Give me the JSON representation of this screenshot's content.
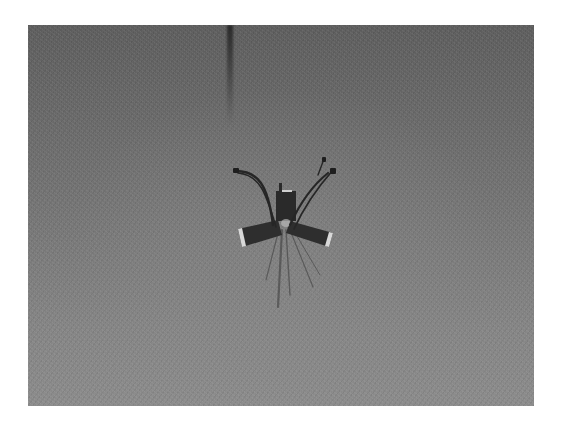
{
  "image": {
    "description": "Grayscale photograph of a small wired electronic device with two flat paddle-like arms forming an X shape and several thin cables, resting on a textured gray surface",
    "colors": {
      "background_top": "#5c5c5c",
      "background_bottom": "#8a8a8a",
      "object": "#2a2a2a",
      "highlight": "#d8d8d8",
      "page": "#ffffff"
    },
    "elements": [
      "central-module",
      "left-paddle",
      "right-paddle",
      "cables",
      "shadow-legs",
      "top-streak"
    ]
  }
}
